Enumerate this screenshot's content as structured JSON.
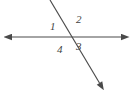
{
  "figure": {
    "type": "geometry-diagram",
    "background_color": "#ffffff",
    "stroke_color": "#4a4a4a",
    "label_color": "#3f3f3f",
    "width": 131,
    "height": 101,
    "lines": [
      {
        "name": "horizontal-line",
        "x1": 9,
        "y1": 37,
        "x2": 124,
        "y2": 37,
        "arrow_start": true,
        "arrow_end": true
      },
      {
        "name": "diagonal-line",
        "x1": 50,
        "y1": 0,
        "x2": 103,
        "y2": 89,
        "arrow_start": false,
        "arrow_end": true
      }
    ],
    "intersection": {
      "x": 68,
      "y": 37
    },
    "labels": [
      {
        "id": "1",
        "text": "1",
        "x": 50,
        "y": 21,
        "position": "upper-left"
      },
      {
        "id": "2",
        "text": "2",
        "x": 76,
        "y": 14,
        "position": "upper-right"
      },
      {
        "id": "3",
        "text": "3",
        "x": 76,
        "y": 41,
        "position": "lower-right"
      },
      {
        "id": "4",
        "text": "4",
        "x": 57,
        "y": 44,
        "position": "lower-left"
      }
    ]
  }
}
